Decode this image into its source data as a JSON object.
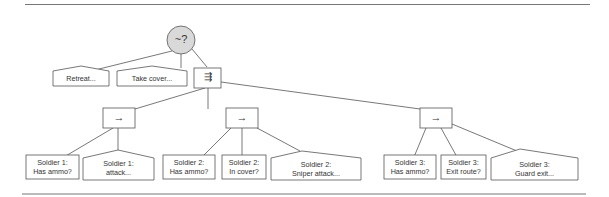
{
  "diagram": {
    "type": "behavior-tree",
    "colors": {
      "line": "#555555",
      "rule": "#777777",
      "root_fill": "#d9d9d9",
      "text": "#333333"
    },
    "root": {
      "symbol": "~?",
      "kind": "random-selector"
    },
    "top_children": [
      {
        "label": "Retreat...",
        "shape": "action"
      },
      {
        "label": "Take cover...",
        "shape": "action"
      },
      {
        "symbol": "⇶",
        "kind": "parallel"
      }
    ],
    "sequences": [
      {
        "symbol": "→",
        "children": [
          {
            "line1": "Soldier 1:",
            "line2": "Has ammo?",
            "shape": "condition"
          },
          {
            "line1": "Soldier 1:",
            "line2": "attack...",
            "shape": "action"
          }
        ]
      },
      {
        "symbol": "→",
        "children": [
          {
            "line1": "Soldier 2:",
            "line2": "Has ammo?",
            "shape": "condition"
          },
          {
            "line1": "Soldier 2:",
            "line2": "In cover?",
            "shape": "condition"
          },
          {
            "line1": "Soldier 2:",
            "line2": "Sniper attack...",
            "shape": "action"
          }
        ]
      },
      {
        "symbol": "→",
        "children": [
          {
            "line1": "Soldier 3:",
            "line2": "Has ammo?",
            "shape": "condition"
          },
          {
            "line1": "Soldier 3:",
            "line2": "Exit route?",
            "shape": "condition"
          },
          {
            "line1": "Soldier 3:",
            "line2": "Guard exit...",
            "shape": "action"
          }
        ]
      }
    ]
  }
}
